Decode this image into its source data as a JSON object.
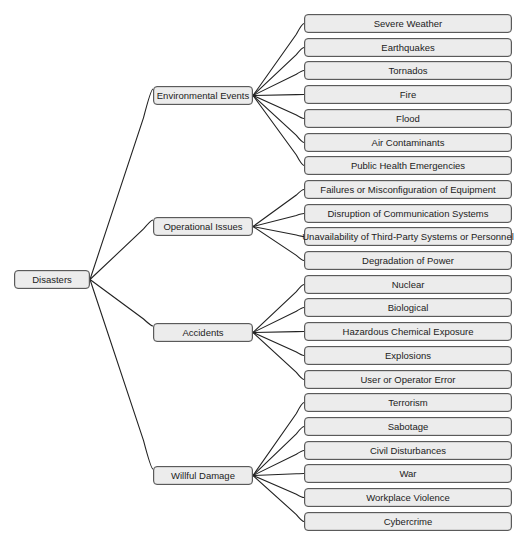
{
  "root": {
    "label": "Disasters"
  },
  "categories": [
    {
      "label": "Environmental Events",
      "items": [
        "Severe Weather",
        "Earthquakes",
        "Tornados",
        "Fire",
        "Flood",
        "Air Contaminants",
        "Public Health Emergencies"
      ]
    },
    {
      "label": "Operational Issues",
      "items": [
        "Failures or Misconfiguration of Equipment",
        "Disruption of Communication Systems",
        "Unavailability of Third-Party Systems or Personnel",
        "Degradation of Power"
      ]
    },
    {
      "label": "Accidents",
      "items": [
        "Nuclear",
        "Biological",
        "Hazardous Chemical Exposure",
        "Explosions",
        "User or Operator Error"
      ]
    },
    {
      "label": "Willful Damage",
      "items": [
        "Terrorism",
        "Sabotage",
        "Civil Disturbances",
        "War",
        "Workplace Violence",
        "Cybercrime"
      ]
    }
  ],
  "colors": {
    "node_fill": "#ececec",
    "node_border": "#5a5a5a",
    "link": "#222222",
    "text": "#222222"
  }
}
